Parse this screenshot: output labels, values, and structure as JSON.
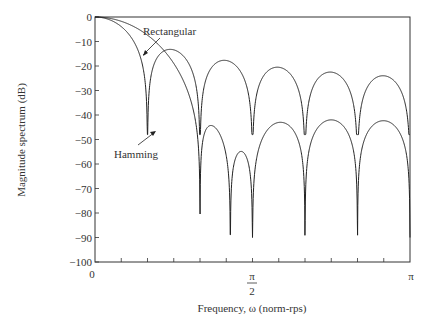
{
  "chart_data": {
    "type": "line",
    "title": "",
    "xlabel": "Frequency, ω (norm-rps)",
    "ylabel": "Magnitude spectrum (dB)",
    "ylim": [
      -100,
      0
    ],
    "xlim": [
      0,
      3.1416
    ],
    "grid": false,
    "legend": "annotations",
    "yticks": [
      0,
      -10,
      -20,
      -30,
      -40,
      -50,
      -60,
      -70,
      -80,
      -90,
      -100
    ],
    "ytick_labels": [
      "0",
      "−10",
      "−20",
      "−30",
      "−40",
      "−50",
      "−60",
      "−70",
      "−80",
      "−90",
      "−100"
    ],
    "xtick_labels": [
      {
        "pos": 0,
        "label": "0"
      },
      {
        "pos": 1.5708,
        "label": "π/2"
      },
      {
        "pos": 3.1416,
        "label": "π"
      }
    ],
    "x_minor_ticks": [
      0.2618,
      0.5236,
      0.7854,
      1.0472,
      1.309,
      1.5708,
      1.8326,
      2.0944,
      2.3562,
      2.618,
      2.8798
    ],
    "series": [
      {
        "name": "Rectangular",
        "nulls_x": [
          0.0842,
          0.349,
          0.616,
          0.884,
          1.146,
          1.409,
          1.67,
          1.931,
          2.193,
          2.454,
          2.716,
          2.977,
          3.1416
        ],
        "nulls_x_visible": [
          0.35,
          0.615,
          0.88,
          1.146,
          1.409,
          1.67,
          1.931,
          2.193,
          2.454,
          2.716,
          2.977
        ],
        "null_depths_db": [
          -37,
          -41,
          -43,
          -46,
          -48,
          -48,
          -48,
          -48
        ],
        "sidelobe_peaks_db": [
          -10,
          -15,
          -17,
          -18,
          -18,
          -19,
          -19
        ],
        "mainlobe": {
          "start_db": 0,
          "null_x": 0.079,
          "null_db": -37
        }
      },
      {
        "name": "Hamming",
        "mainlobe": {
          "start_db": 0,
          "null_x": 0.44,
          "null_db": -84
        },
        "nulls_x": [
          0.44,
          0.88,
          1.146,
          1.409,
          1.67,
          1.931,
          2.193,
          2.454,
          2.716,
          2.977
        ],
        "null_depths_db": [
          -84,
          -90,
          -80,
          -74,
          -87
        ],
        "sidelobe_peaks_db": [
          -40,
          -39,
          -40,
          -42,
          -44
        ]
      }
    ],
    "annotations": [
      {
        "text": "Rectangular",
        "arrow_to": "Rectangular sidelobe near ω≈0.33, −20 dB"
      },
      {
        "text": "Hamming",
        "arrow_to": "Hamming mainlobe near ω≈0.4, −45 dB"
      }
    ]
  },
  "labels": {
    "ylabel": "Magnitude spectrum (dB)",
    "xlabel": "Frequency, ω (norm-rps)",
    "rect": "Rectangular",
    "hamming": "Hamming",
    "x0": "0",
    "xpi_num": "π",
    "xpi_den": "2",
    "xpi": "π"
  }
}
